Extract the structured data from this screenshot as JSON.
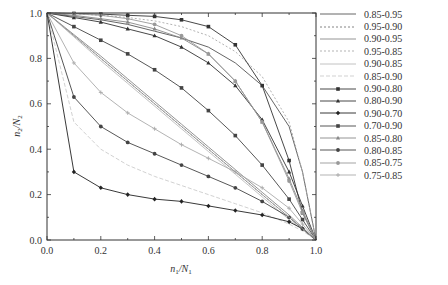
{
  "chart_data": {
    "type": "line",
    "title": "",
    "xlabel": "n1/N1",
    "ylabel": "n2/N2",
    "xlim": [
      0,
      1
    ],
    "ylim": [
      0,
      1
    ],
    "grid": false,
    "legend_position": "right-outside",
    "x_ticks": [
      "0.0",
      "0.2",
      "0.4",
      "0.6",
      "0.8",
      "1.0"
    ],
    "y_ticks": [
      "0.0",
      "0.2",
      "0.4",
      "0.6",
      "0.8",
      "1.0"
    ],
    "x": [
      0,
      0.1,
      0.2,
      0.3,
      0.4,
      0.5,
      0.6,
      0.7,
      0.8,
      0.9,
      0.95,
      1.0
    ],
    "series": [
      {
        "name": "0.85-0.95",
        "color": "#555555",
        "dash": "",
        "marker": "none",
        "values": [
          1.0,
          0.985,
          0.97,
          0.95,
          0.92,
          0.89,
          0.85,
          0.78,
          0.68,
          0.5,
          0.3,
          0.0
        ]
      },
      {
        "name": "0.95-0.90",
        "color": "#777777",
        "dash": "2,2",
        "marker": "none",
        "values": [
          1.0,
          0.9,
          0.8,
          0.7,
          0.6,
          0.5,
          0.4,
          0.3,
          0.2,
          0.1,
          0.05,
          0.0
        ]
      },
      {
        "name": "0.90-0.95",
        "color": "#888888",
        "dash": "",
        "marker": "none",
        "values": [
          1.0,
          0.905,
          0.81,
          0.71,
          0.61,
          0.51,
          0.41,
          0.31,
          0.21,
          0.11,
          0.055,
          0.0
        ]
      },
      {
        "name": "0.95-0.85",
        "color": "#aaaaaa",
        "dash": "2,2",
        "marker": "none",
        "values": [
          1.0,
          0.997,
          0.99,
          0.98,
          0.965,
          0.94,
          0.9,
          0.83,
          0.72,
          0.52,
          0.3,
          0.0
        ]
      },
      {
        "name": "0.90-0.85",
        "color": "#bbbbbb",
        "dash": "",
        "marker": "none",
        "values": [
          1.0,
          0.895,
          0.79,
          0.69,
          0.59,
          0.49,
          0.39,
          0.29,
          0.19,
          0.09,
          0.045,
          0.0
        ]
      },
      {
        "name": "0.85-0.90",
        "color": "#cccccc",
        "dash": "4,2",
        "marker": "none",
        "values": [
          1.0,
          0.52,
          0.4,
          0.33,
          0.28,
          0.24,
          0.2,
          0.16,
          0.12,
          0.07,
          0.04,
          0.0
        ]
      },
      {
        "name": "0.90-0.80",
        "color": "#333333",
        "dash": "",
        "marker": "square",
        "values": [
          1.0,
          0.998,
          0.995,
          0.99,
          0.985,
          0.97,
          0.94,
          0.86,
          0.68,
          0.35,
          0.12,
          0.0
        ]
      },
      {
        "name": "0.80-0.90",
        "color": "#333333",
        "dash": "",
        "marker": "triangle",
        "values": [
          1.0,
          0.98,
          0.96,
          0.93,
          0.9,
          0.85,
          0.78,
          0.68,
          0.53,
          0.3,
          0.15,
          0.0
        ]
      },
      {
        "name": "0.90-0.70",
        "color": "#222222",
        "dash": "",
        "marker": "diamond",
        "values": [
          1.0,
          0.3,
          0.23,
          0.2,
          0.18,
          0.17,
          0.15,
          0.13,
          0.11,
          0.08,
          0.05,
          0.0
        ]
      },
      {
        "name": "0.70-0.90",
        "color": "#444444",
        "dash": "",
        "marker": "square",
        "values": [
          1.0,
          0.94,
          0.88,
          0.82,
          0.75,
          0.67,
          0.57,
          0.46,
          0.33,
          0.18,
          0.09,
          0.0
        ]
      },
      {
        "name": "0.85-0.80",
        "color": "#888888",
        "dash": "",
        "marker": "triangle",
        "values": [
          1.0,
          0.99,
          0.975,
          0.96,
          0.93,
          0.89,
          0.82,
          0.7,
          0.52,
          0.27,
          0.13,
          0.0
        ]
      },
      {
        "name": "0.80-0.85",
        "color": "#444444",
        "dash": "",
        "marker": "circle",
        "values": [
          1.0,
          0.63,
          0.5,
          0.43,
          0.38,
          0.33,
          0.28,
          0.23,
          0.17,
          0.1,
          0.05,
          0.0
        ]
      },
      {
        "name": "0.85-0.75",
        "color": "#999999",
        "dash": "",
        "marker": "circle",
        "values": [
          1.0,
          0.997,
          0.99,
          0.975,
          0.95,
          0.9,
          0.82,
          0.7,
          0.52,
          0.26,
          0.12,
          0.0
        ]
      },
      {
        "name": "0.75-0.85",
        "color": "#aaaaaa",
        "dash": "",
        "marker": "plus",
        "values": [
          1.0,
          0.78,
          0.65,
          0.56,
          0.49,
          0.42,
          0.36,
          0.3,
          0.23,
          0.14,
          0.07,
          0.0
        ]
      },
      {
        "name": "0.85-0.85",
        "color": "#999999",
        "dash": "",
        "marker": "none",
        "values": [
          1.0,
          0.9,
          0.8,
          0.7,
          0.6,
          0.5,
          0.4,
          0.3,
          0.2,
          0.1,
          0.05,
          0.0
        ]
      }
    ]
  },
  "legend": {
    "items": [
      {
        "label": "0.85-0.95",
        "color": "#555555",
        "dash": "",
        "marker": "none"
      },
      {
        "label": "0.95-0.90",
        "color": "#777777",
        "dash": "2,2",
        "marker": "none"
      },
      {
        "label": "0.90-0.95",
        "color": "#888888",
        "dash": "",
        "marker": "none"
      },
      {
        "label": "0.95-0.85",
        "color": "#aaaaaa",
        "dash": "2,2",
        "marker": "none"
      },
      {
        "label": "0.90-0.85",
        "color": "#bbbbbb",
        "dash": "",
        "marker": "none"
      },
      {
        "label": "0.85-0.90",
        "color": "#cccccc",
        "dash": "4,2",
        "marker": "none"
      },
      {
        "label": "0.90-0.80",
        "color": "#333333",
        "dash": "",
        "marker": "square"
      },
      {
        "label": "0.80-0.90",
        "color": "#333333",
        "dash": "",
        "marker": "triangle"
      },
      {
        "label": "0.90-0.70",
        "color": "#222222",
        "dash": "",
        "marker": "diamond"
      },
      {
        "label": "0.70-0.90",
        "color": "#444444",
        "dash": "",
        "marker": "square"
      },
      {
        "label": "0.85-0.80",
        "color": "#888888",
        "dash": "",
        "marker": "triangle"
      },
      {
        "label": "0.80-0.85",
        "color": "#444444",
        "dash": "",
        "marker": "circle"
      },
      {
        "label": "0.85-0.75",
        "color": "#999999",
        "dash": "",
        "marker": "circle"
      },
      {
        "label": "0.75-0.85",
        "color": "#aaaaaa",
        "dash": "",
        "marker": "plus"
      }
    ]
  },
  "axes": {
    "xlabel_main": "n",
    "xlabel_sub1": "1",
    "xlabel_slash": "/N",
    "xlabel_sub2": "1",
    "ylabel_main": "n",
    "ylabel_sub1": "2",
    "ylabel_slash": "/N",
    "ylabel_sub2": "2"
  }
}
